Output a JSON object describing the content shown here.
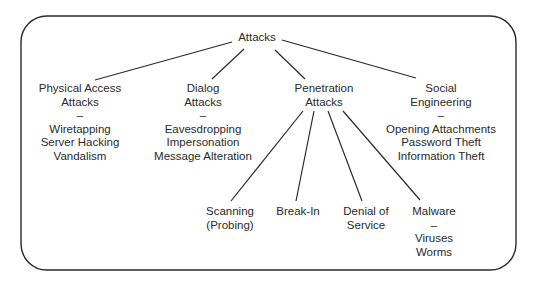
{
  "root": {
    "label": "Attacks"
  },
  "categories": [
    {
      "title": [
        "Physical Access",
        "Attacks"
      ],
      "separator": "–",
      "items": [
        "Wiretapping",
        "Server Hacking",
        "Vandalism"
      ]
    },
    {
      "title": [
        "Dialog",
        "Attacks"
      ],
      "separator": "–",
      "items": [
        "Eavesdropping",
        "Impersonation",
        "Message Alteration"
      ]
    },
    {
      "title": [
        "Penetration",
        "Attacks"
      ],
      "separator": "",
      "items": []
    },
    {
      "title": [
        "Social",
        "Engineering"
      ],
      "separator": "–",
      "items": [
        "Opening Attachments",
        "Password Theft",
        "Information Theft"
      ]
    }
  ],
  "penetration_children": [
    {
      "title": [
        "Scanning",
        "(Probing)"
      ],
      "separator": "",
      "items": []
    },
    {
      "title": [
        "Break-In"
      ],
      "separator": "",
      "items": []
    },
    {
      "title": [
        "Denial of",
        "Service"
      ],
      "separator": "",
      "items": []
    },
    {
      "title": [
        "Malware"
      ],
      "separator": "–",
      "items": [
        "Viruses",
        "Worms"
      ]
    }
  ],
  "colors": {
    "line": "#2a2a2a",
    "text": "#2a2a2a",
    "background": "#ffffff"
  }
}
